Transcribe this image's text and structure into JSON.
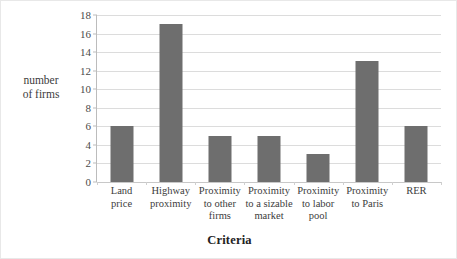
{
  "chart_data": {
    "type": "bar",
    "title": "",
    "xlabel": "Criteria",
    "ylabel": "number of firms",
    "ylabel_lines": [
      "number",
      "of firms"
    ],
    "categories": [
      "Land price",
      "Highway proximity",
      "Proximity to other firms",
      "Proximity to a sizable market",
      "Proximity to labor pool",
      "Proximity to Paris",
      "RER"
    ],
    "category_label_lines": [
      [
        "Land",
        "price"
      ],
      [
        "Highway",
        "proximity"
      ],
      [
        "Proximity",
        "to other",
        "firms"
      ],
      [
        "Proximity",
        "to a sizable",
        "market"
      ],
      [
        "Proximity",
        "to labor",
        "pool"
      ],
      [
        "Proximity",
        "to Paris"
      ],
      [
        "RER"
      ]
    ],
    "values": [
      6,
      17,
      5,
      5,
      3,
      13,
      6
    ],
    "ylim": [
      0,
      18
    ],
    "ytick_labels": [
      "0",
      "2",
      "4",
      "6",
      "8",
      "10",
      "12",
      "14",
      "16",
      "18"
    ],
    "ytick_values": [
      0,
      2,
      4,
      6,
      8,
      10,
      12,
      14,
      16,
      18
    ],
    "grid": true,
    "legend": false,
    "bar_color": "#6e6e6e",
    "gridline_color": "#dcdcdc",
    "axis_color": "#bcbcbc",
    "background_color": "#ffffff"
  }
}
